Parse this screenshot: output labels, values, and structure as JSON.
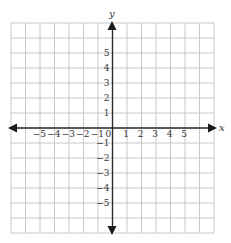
{
  "diagram": {
    "type": "coordinate-plane",
    "axis_labels": {
      "x": "x",
      "y": "y"
    },
    "grid": {
      "columns": 14,
      "rows": 14,
      "origin_col": 7,
      "origin_row": 7
    },
    "x_ticks": [
      {
        "value": -5,
        "label": "−5"
      },
      {
        "value": -4,
        "label": "−4"
      },
      {
        "value": -3,
        "label": "−3"
      },
      {
        "value": -2,
        "label": "−2"
      },
      {
        "value": -1,
        "label": "−1"
      },
      {
        "value": 1,
        "label": "1"
      },
      {
        "value": 2,
        "label": "2"
      },
      {
        "value": 3,
        "label": "3"
      },
      {
        "value": 4,
        "label": "4"
      },
      {
        "value": 5,
        "label": "5"
      }
    ],
    "y_ticks": [
      {
        "value": 5,
        "label": "5"
      },
      {
        "value": 4,
        "label": "4"
      },
      {
        "value": 3,
        "label": "3"
      },
      {
        "value": 2,
        "label": "2"
      },
      {
        "value": 1,
        "label": "1"
      },
      {
        "value": -1,
        "label": "−1"
      },
      {
        "value": -2,
        "label": "−2"
      },
      {
        "value": -3,
        "label": "−3"
      },
      {
        "value": -4,
        "label": "−4"
      },
      {
        "value": -5,
        "label": "−5"
      }
    ],
    "origin_label": "0",
    "colors": {
      "grid": "#c8c8c8",
      "axis": "#2b2b2b",
      "text": "#333333"
    }
  }
}
